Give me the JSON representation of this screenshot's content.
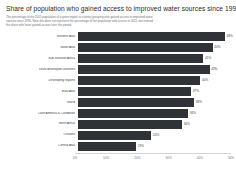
{
  "header": {
    "title": "Share of population who gained access to improved water sources since 1990",
    "subtitle": "The percentage of the 2015 population of a given region or country grouping who gained access to improved water sources since 1990. Note this does not represent the percentage of the population with access in 2015, but instead the share who have gained access over this period."
  },
  "chart_data": {
    "type": "bar",
    "orientation": "horizontal",
    "title": "Share of population who gained access to improved water sources since 1990",
    "xlabel": "",
    "ylabel": "",
    "xlim": [
      0,
      50
    ],
    "xticks": [
      "0%",
      "10%",
      "20%",
      "30%",
      "40%",
      "50%"
    ],
    "xtick_values": [
      0,
      10,
      20,
      30,
      40,
      50
    ],
    "grid": false,
    "legend": false,
    "bar_color": "#2f3337",
    "categories": [
      "Western Asia",
      "South Asia",
      "Sub-Saharan Africa",
      "Least developed countries",
      "Developing regions",
      "East Asia",
      "World",
      "Latin America & Caribbean",
      "North Africa",
      "Oceania",
      "Central Asia"
    ],
    "values": [
      48,
      44,
      41,
      43,
      40,
      37,
      38,
      36,
      34,
      24,
      19
    ],
    "labels": [
      "48%",
      "44%",
      "41%",
      "43%",
      "40%",
      "37%",
      "38%",
      "36%",
      "34%",
      "24%",
      "19%"
    ]
  }
}
